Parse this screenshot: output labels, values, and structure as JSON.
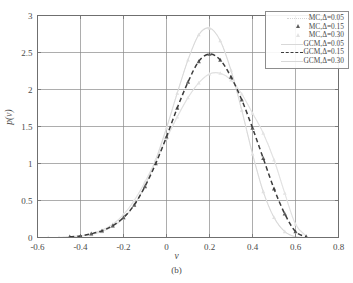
{
  "chart_data": {
    "type": "line",
    "title": "",
    "xlabel": "v",
    "ylabel": "p(v)",
    "caption": "(b)",
    "xlim": [
      -0.6,
      0.8
    ],
    "ylim": [
      0,
      3
    ],
    "xticks": [
      "-0.6",
      "-0.4",
      "-0.2",
      "0",
      "0.2",
      "0.4",
      "0.6",
      "0.8"
    ],
    "xtick_values": [
      -0.6,
      -0.4,
      -0.2,
      0,
      0.2,
      0.4,
      0.6,
      0.8
    ],
    "yticks": [
      "0",
      "0.5",
      "1",
      "1.5",
      "2",
      "2.5",
      "3"
    ],
    "ytick_values": [
      0,
      0.5,
      1,
      1.5,
      2,
      2.5,
      3
    ],
    "grid": true,
    "legend_position": "top-right",
    "series": [
      {
        "name": "MC,Δ=0.05",
        "style": "dotted-markers",
        "color": "#e0e0e0",
        "marker": "triangle",
        "x": [
          -0.6,
          -0.55,
          -0.5,
          -0.45,
          -0.4,
          -0.35,
          -0.3,
          -0.25,
          -0.2,
          -0.15,
          -0.1,
          -0.05,
          0.0,
          0.05,
          0.1,
          0.15,
          0.2,
          0.25,
          0.3,
          0.35,
          0.4,
          0.45,
          0.5,
          0.55,
          0.6,
          0.65
        ],
        "y": [
          0.0,
          0.0,
          0.0,
          0.01,
          0.02,
          0.04,
          0.08,
          0.15,
          0.26,
          0.44,
          0.7,
          1.05,
          1.48,
          1.95,
          2.4,
          2.74,
          2.83,
          2.66,
          2.26,
          1.72,
          1.13,
          0.62,
          0.27,
          0.08,
          0.01,
          0.0
        ]
      },
      {
        "name": "MC,Δ=0.15",
        "style": "markers",
        "color": "#5d5d5d",
        "marker": "triangle",
        "x": [
          -0.45,
          -0.4,
          -0.35,
          -0.3,
          -0.25,
          -0.2,
          -0.15,
          -0.1,
          -0.05,
          0.0,
          0.05,
          0.1,
          0.15,
          0.2,
          0.25,
          0.3,
          0.35,
          0.4,
          0.45,
          0.5,
          0.55,
          0.6,
          0.65
        ],
        "y": [
          0.01,
          0.02,
          0.05,
          0.09,
          0.16,
          0.27,
          0.44,
          0.69,
          1.0,
          1.36,
          1.75,
          2.1,
          2.38,
          2.48,
          2.4,
          2.17,
          1.86,
          1.48,
          1.07,
          0.66,
          0.32,
          0.08,
          0.01
        ]
      },
      {
        "name": "MC,Δ=0.30",
        "style": "dotted-markers",
        "color": "#e4e4e4",
        "marker": "triangle",
        "x": [
          -0.45,
          -0.4,
          -0.35,
          -0.3,
          -0.25,
          -0.2,
          -0.15,
          -0.1,
          -0.05,
          0.0,
          0.05,
          0.1,
          0.15,
          0.2,
          0.25,
          0.3,
          0.35,
          0.4,
          0.45,
          0.5,
          0.55,
          0.6,
          0.65
        ],
        "y": [
          0.01,
          0.02,
          0.05,
          0.1,
          0.18,
          0.31,
          0.5,
          0.75,
          1.04,
          1.34,
          1.63,
          1.89,
          2.09,
          2.21,
          2.22,
          2.13,
          1.94,
          1.68,
          1.41,
          1.05,
          0.6,
          0.18,
          0.02
        ]
      },
      {
        "name": "GCM,Δ=0.05",
        "style": "solid",
        "color": "#d8d8d8",
        "x": [
          -0.6,
          -0.55,
          -0.5,
          -0.45,
          -0.4,
          -0.35,
          -0.3,
          -0.25,
          -0.2,
          -0.15,
          -0.1,
          -0.05,
          0.0,
          0.05,
          0.1,
          0.15,
          0.2,
          0.25,
          0.3,
          0.35,
          0.4,
          0.45,
          0.5,
          0.55,
          0.6,
          0.65
        ],
        "y": [
          0.0,
          0.0,
          0.0,
          0.01,
          0.02,
          0.04,
          0.08,
          0.15,
          0.26,
          0.44,
          0.7,
          1.05,
          1.48,
          1.95,
          2.4,
          2.74,
          2.83,
          2.66,
          2.26,
          1.72,
          1.13,
          0.62,
          0.27,
          0.08,
          0.01,
          0.0
        ]
      },
      {
        "name": "GCM,Δ=0.15",
        "style": "dashed",
        "color": "#3c3c3c",
        "marker": "triangle",
        "x": [
          -0.45,
          -0.4,
          -0.35,
          -0.3,
          -0.25,
          -0.2,
          -0.15,
          -0.1,
          -0.05,
          0.0,
          0.05,
          0.1,
          0.15,
          0.2,
          0.25,
          0.3,
          0.35,
          0.4,
          0.45,
          0.5,
          0.55,
          0.6,
          0.65
        ],
        "y": [
          0.01,
          0.02,
          0.05,
          0.09,
          0.16,
          0.27,
          0.44,
          0.69,
          1.0,
          1.36,
          1.75,
          2.1,
          2.38,
          2.48,
          2.4,
          2.17,
          1.86,
          1.48,
          1.07,
          0.66,
          0.32,
          0.08,
          0.01
        ]
      },
      {
        "name": "GCM,Δ=0.30",
        "style": "solid",
        "color": "#e0e0e0",
        "x": [
          -0.45,
          -0.4,
          -0.35,
          -0.3,
          -0.25,
          -0.2,
          -0.15,
          -0.1,
          -0.05,
          0.0,
          0.05,
          0.1,
          0.15,
          0.2,
          0.25,
          0.3,
          0.35,
          0.4,
          0.45,
          0.5,
          0.55,
          0.6,
          0.65
        ],
        "y": [
          0.01,
          0.02,
          0.05,
          0.1,
          0.18,
          0.31,
          0.5,
          0.75,
          1.04,
          1.34,
          1.63,
          1.89,
          2.09,
          2.21,
          2.22,
          2.13,
          1.94,
          1.68,
          1.41,
          1.05,
          0.6,
          0.18,
          0.02
        ]
      }
    ]
  },
  "legend": {
    "entries": [
      {
        "label": "MC,Δ=0.05",
        "sample": "dotted-faint"
      },
      {
        "label": "MC,Δ=0.15",
        "sample": "triangle"
      },
      {
        "label": "MC,Δ=0.30",
        "sample": "dotted-faint2"
      },
      {
        "label": "GCM,Δ=0.05",
        "sample": "solid-faint"
      },
      {
        "label": "GCM,Δ=0.15",
        "sample": "dashed"
      },
      {
        "label": "GCM,Δ=0.30",
        "sample": "solid-faint2"
      }
    ]
  },
  "colors": {
    "axis": "#6f6f6f",
    "grid": "#8a8a8a",
    "dark_series": "#3c3c3c",
    "faint_series": "#dcdcdc",
    "text": "#4a4a4a"
  }
}
